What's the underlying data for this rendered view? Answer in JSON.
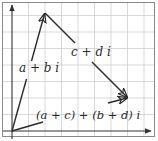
{
  "diagram": {
    "type": "complex-plane-vector-addition",
    "grid": {
      "color": "#c9c9c9",
      "cols": 9,
      "rows": 8,
      "spacing": 16.5
    },
    "frame_color": "#8a8a8a",
    "axis_color": "#333333",
    "vector_color": "#2a2a2a",
    "origin": [
      12,
      131
    ],
    "vectors": [
      {
        "id": "z1",
        "label": "a + b i",
        "from": [
          12,
          131
        ],
        "to": [
          45,
          13
        ]
      },
      {
        "id": "z2",
        "label": "c + d i",
        "from": [
          45,
          13
        ],
        "to": [
          128,
          98
        ]
      },
      {
        "id": "sum",
        "label": "(a + c) + (b + d) i",
        "from": [
          12,
          131
        ],
        "to": [
          128,
          98
        ]
      }
    ],
    "labels": {
      "z1": "a + b i",
      "z2": "c + d i",
      "sum": "(a + c) + (b + d) i"
    }
  }
}
